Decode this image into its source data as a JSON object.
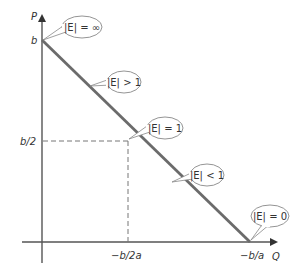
{
  "diagram": {
    "type": "linear-demand-elasticity",
    "axes": {
      "y_label": "P",
      "x_label": "Q"
    },
    "y_ticks": [
      {
        "label": "b",
        "position": "intercept"
      },
      {
        "label": "b/2",
        "position": "midpoint"
      }
    ],
    "x_ticks": [
      {
        "label": "−b/2a",
        "position": "midpoint"
      },
      {
        "label": "−b/a",
        "position": "intercept"
      }
    ],
    "callouts": [
      {
        "text": "|E| = ∞",
        "location": "P-intercept"
      },
      {
        "text": "|E| > 1",
        "location": "upper segment"
      },
      {
        "text": "|E| = 1",
        "location": "midpoint"
      },
      {
        "text": "|E| < 1",
        "location": "lower segment"
      },
      {
        "text": "|E| = 0",
        "location": "Q-intercept"
      }
    ],
    "colors": {
      "demand_line": "#6b6b6b",
      "axis": "#555555",
      "guides": "#777777",
      "bubble_stroke": "#888888",
      "text": "#333333"
    }
  }
}
